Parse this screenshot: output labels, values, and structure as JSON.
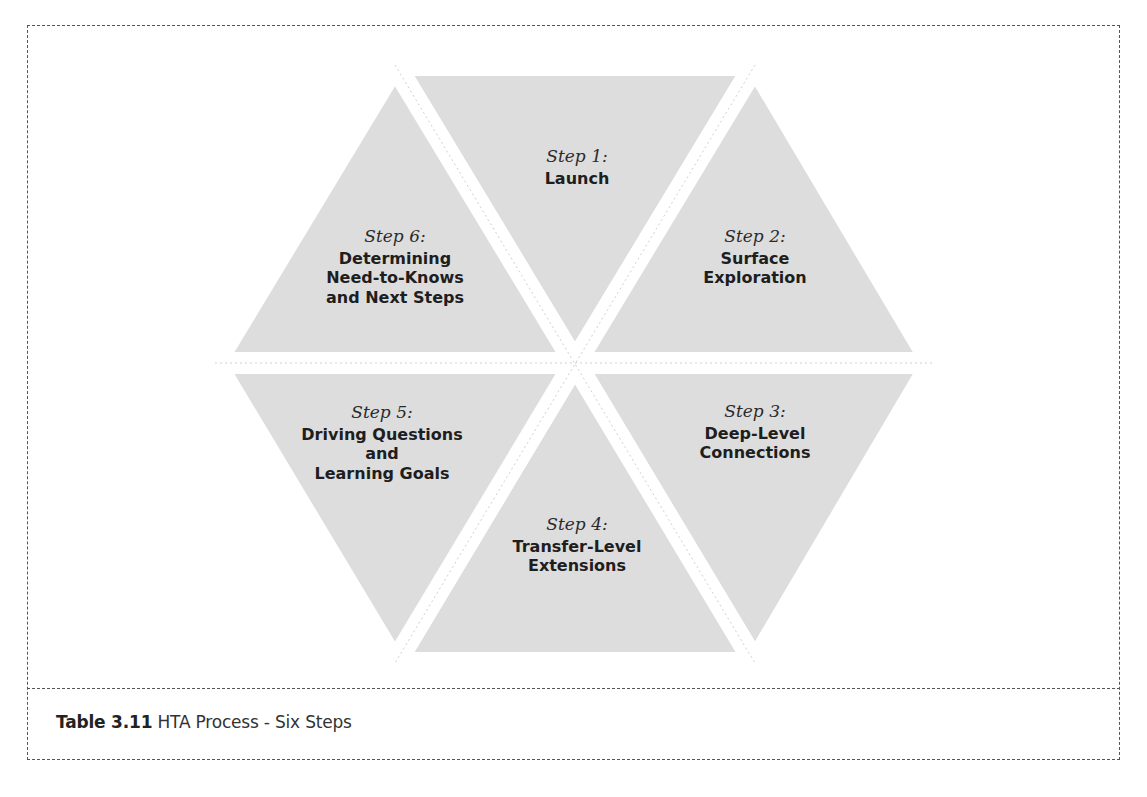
{
  "figure": {
    "caption_label": "Table 3.11",
    "caption_text": " HTA Process - Six Steps"
  },
  "colors": {
    "triangle_fill": "#dddddd",
    "gap": "#ffffff",
    "outline": "#c8c8c8",
    "frame": "#555555"
  },
  "steps": [
    {
      "step": "Step 1:",
      "title": "Launch"
    },
    {
      "step": "Step 2:",
      "title": "Surface\nExploration"
    },
    {
      "step": "Step 3:",
      "title": "Deep-Level\nConnections"
    },
    {
      "step": "Step 4:",
      "title": "Transfer-Level\nExtensions"
    },
    {
      "step": "Step 5:",
      "title": "Driving Questions\nand\nLearning Goals"
    },
    {
      "step": "Step 6:",
      "title": "Determining\nNeed-to-Knows\nand Next Steps"
    }
  ]
}
